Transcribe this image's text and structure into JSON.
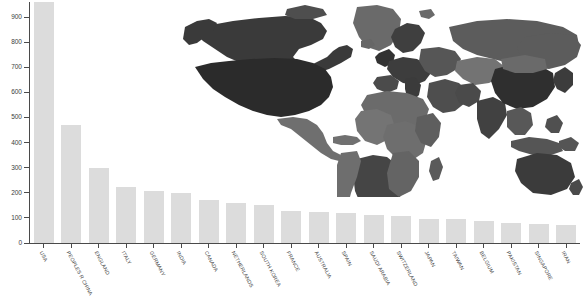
{
  "chart_data": {
    "type": "bar",
    "title": "",
    "subtitle": "",
    "xlabel": "",
    "ylabel": "",
    "ylim": [
      0,
      960
    ],
    "yticks": [
      0,
      100,
      200,
      300,
      400,
      500,
      600,
      700,
      800,
      900
    ],
    "ytick_labels": [
      "0",
      "100",
      "200",
      "300",
      "400",
      "500",
      "600",
      "700",
      "800",
      "900"
    ],
    "grid": false,
    "legend": null,
    "bar_color": "#dcdcdc",
    "axis_color": "#4a4a4a",
    "text_color": "#3c3c3c",
    "categories": [
      "USA",
      "PEOPLES R CHINA",
      "ENGLAND",
      "ITALY",
      "GERMANY",
      "INDIA",
      "CANADA",
      "NETHERLANDS",
      "SOUTH KOREA",
      "FRANCE",
      "AUSTRALIA",
      "SPAIN",
      "SAUDI ARABIA",
      "SWITZERLAND",
      "JAPAN",
      "TAIWAN",
      "BELGIUM",
      "PAKISTAN",
      "SINGAPORE",
      "IRAN"
    ],
    "values": [
      960,
      470,
      297,
      222,
      207,
      200,
      170,
      160,
      152,
      127,
      122,
      118,
      112,
      107,
      96,
      94,
      86,
      80,
      75,
      70
    ]
  },
  "map": {
    "name": "world-choropleth",
    "description": "World map choropleth overlay, grayscale shading by country",
    "shades": {
      "darkest": "#2e2e2e",
      "dark": "#3f3f3f",
      "medium_dark": "#4d4d4d",
      "medium": "#5e5e5e",
      "medium_light": "#6e6e6e",
      "light": "#7d7d7d",
      "lightest": "#8c8c8c",
      "ocean": "#ffffff"
    }
  }
}
